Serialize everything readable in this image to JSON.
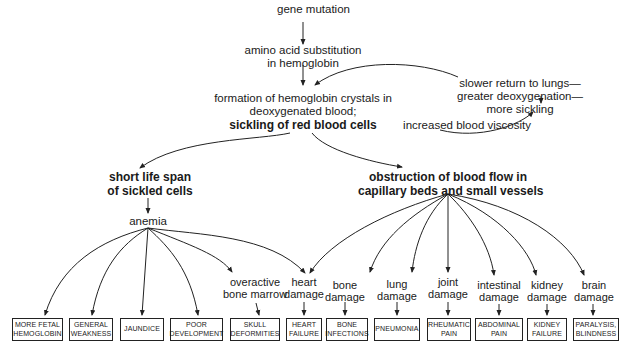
{
  "diagram": {
    "title_node": "gene mutation",
    "chain": [
      {
        "id": "amino",
        "lines": [
          "amino acid substitution",
          "in hemoglobin"
        ]
      },
      {
        "id": "formation",
        "lines": [
          "formation of hemoglobin crystals in",
          "deoxygenated blood;"
        ],
        "bold_line": "sickling of red blood cells"
      }
    ],
    "feedback_loop": {
      "viscosity": "increased blood viscosity",
      "slower_lines": [
        "slower return to lungs—",
        "greater deoxygenation—",
        "more sickling"
      ]
    },
    "branches": {
      "short_life": [
        "short life span",
        "of sickled cells"
      ],
      "obstruction": [
        "obstruction of blood flow in",
        "capillary beds and small vessels"
      ],
      "anemia": "anemia",
      "overactive": [
        "overactive",
        "bone marrow"
      ]
    },
    "damages": [
      {
        "id": "heart",
        "lines": [
          "heart",
          "damage"
        ]
      },
      {
        "id": "bone",
        "lines": [
          "bone",
          "damage"
        ]
      },
      {
        "id": "lung",
        "lines": [
          "lung",
          "damage"
        ]
      },
      {
        "id": "joint",
        "lines": [
          "joint",
          "damage"
        ]
      },
      {
        "id": "intestinal",
        "lines": [
          "intestinal",
          "damage"
        ]
      },
      {
        "id": "kidney",
        "lines": [
          "kidney",
          "damage"
        ]
      },
      {
        "id": "brain",
        "lines": [
          "brain",
          "damage"
        ]
      }
    ],
    "outcomes": [
      {
        "lines": [
          "MORE FETAL",
          "HEMOGLOBIN"
        ]
      },
      {
        "lines": [
          "GENERAL",
          "WEAKNESS"
        ]
      },
      {
        "lines": [
          "JAUNDICE"
        ]
      },
      {
        "lines": [
          "POOR",
          "DEVELOPMENT"
        ]
      },
      {
        "lines": [
          "SKULL",
          "DEFORMITIES"
        ]
      },
      {
        "lines": [
          "HEART",
          "FAILURE"
        ]
      },
      {
        "lines": [
          "BONE",
          "INFECTIONS"
        ]
      },
      {
        "lines": [
          "PNEUMONIA"
        ]
      },
      {
        "lines": [
          "RHEUMATIC",
          "PAIN"
        ]
      },
      {
        "lines": [
          "ABDOMINAL",
          "PAIN"
        ]
      },
      {
        "lines": [
          "KIDNEY",
          "FAILURE"
        ]
      },
      {
        "lines": [
          "PARALYSIS,",
          "BLINDNESS"
        ]
      }
    ]
  }
}
